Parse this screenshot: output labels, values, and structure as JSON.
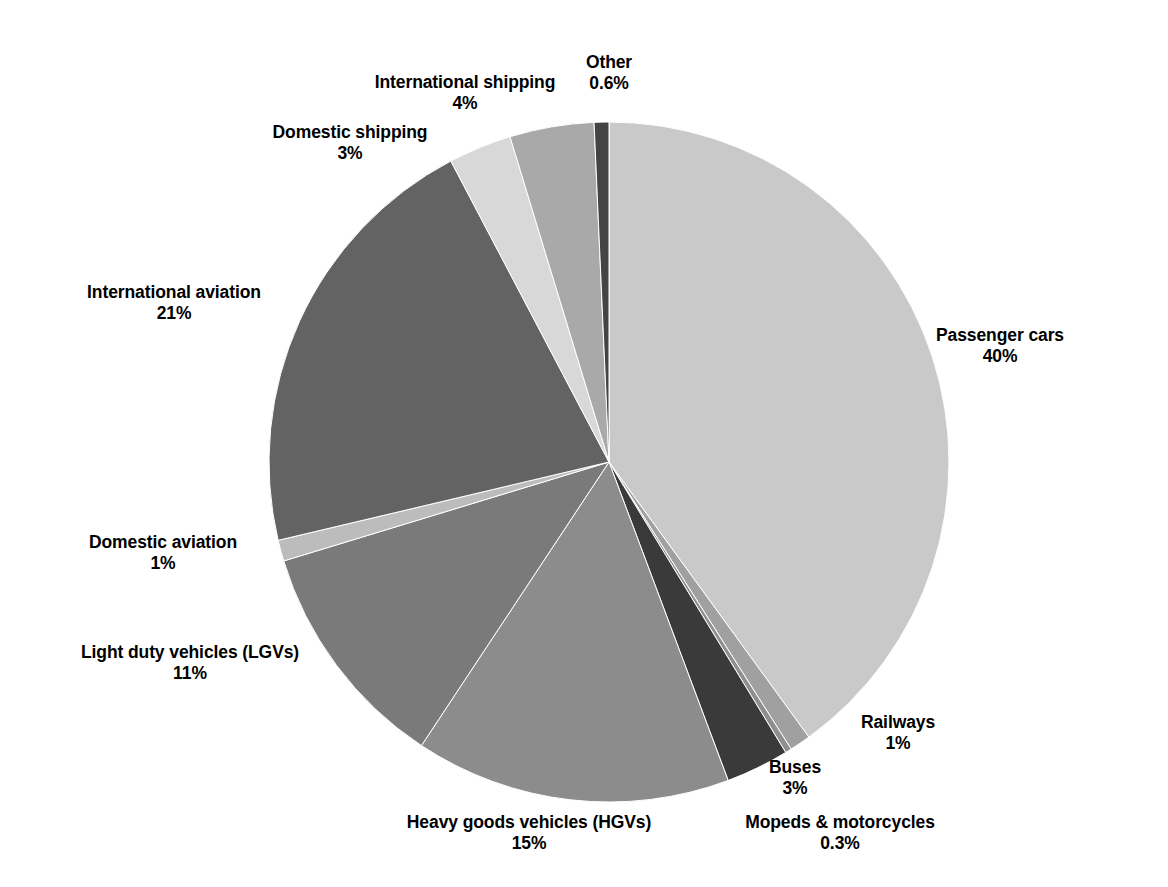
{
  "chart_data": {
    "type": "pie",
    "title": "",
    "subtitle": "",
    "xlabel": "",
    "ylabel": "",
    "legend_position": "none",
    "grid": false,
    "units": "percent",
    "label_format": "name on first line, percentage on second line",
    "start_angle_deg": 0,
    "direction": "clockwise from 12 o'clock",
    "categories": [
      "Passenger cars",
      "Railways",
      "Mopeds & motorcycles",
      "Buses",
      "Heavy goods vehicles (HGVs)",
      "Light duty vehicles (LGVs)",
      "Domestic aviation",
      "International aviation",
      "Domestic shipping",
      "International shipping",
      "Other"
    ],
    "values": [
      40,
      1,
      0.3,
      3,
      15,
      11,
      1,
      21,
      3,
      4,
      0.6
    ],
    "value_labels": [
      "40%",
      "1%",
      "0.3%",
      "3%",
      "15%",
      "11%",
      "1%",
      "21%",
      "3%",
      "4%",
      "0.6%"
    ],
    "colors": [
      "#c9c9c9",
      "#a0a0a0",
      "#8f8f8f",
      "#3a3a3a",
      "#8c8c8c",
      "#7a7a7a",
      "#bcbcbc",
      "#636363",
      "#d8d8d8",
      "#a9a9a9",
      "#444444"
    ],
    "slices": [
      {
        "name": "Passenger cars",
        "value": 40,
        "value_label": "40%",
        "color": "#c9c9c9",
        "start_deg": 0,
        "end_deg": 144,
        "label_x": 1000,
        "label_y": 325,
        "anchor": "center"
      },
      {
        "name": "Railways",
        "value": 1,
        "value_label": "1%",
        "color": "#a0a0a0",
        "start_deg": 144,
        "end_deg": 147.6,
        "label_x": 898,
        "label_y": 712,
        "anchor": "center"
      },
      {
        "name": "Mopeds & motorcycles",
        "value": 0.3,
        "value_label": "0.3%",
        "color": "#8f8f8f",
        "start_deg": 147.6,
        "end_deg": 148.68,
        "label_x": 840,
        "label_y": 812,
        "anchor": "center"
      },
      {
        "name": "Buses",
        "value": 3,
        "value_label": "3%",
        "color": "#3a3a3a",
        "start_deg": 148.68,
        "end_deg": 159.48,
        "label_x": 795,
        "label_y": 757,
        "anchor": "center"
      },
      {
        "name": "Heavy goods vehicles (HGVs)",
        "value": 15,
        "value_label": "15%",
        "color": "#8c8c8c",
        "start_deg": 159.48,
        "end_deg": 213.48,
        "label_x": 529,
        "label_y": 812,
        "anchor": "center"
      },
      {
        "name": "Light duty vehicles (LGVs)",
        "value": 11,
        "value_label": "11%",
        "color": "#7a7a7a",
        "start_deg": 213.48,
        "end_deg": 253.08,
        "label_x": 190,
        "label_y": 642,
        "anchor": "center"
      },
      {
        "name": "Domestic aviation",
        "value": 1,
        "value_label": "1%",
        "color": "#bcbcbc",
        "start_deg": 253.08,
        "end_deg": 256.68,
        "label_x": 163,
        "label_y": 532,
        "anchor": "center"
      },
      {
        "name": "International aviation",
        "value": 21,
        "value_label": "21%",
        "color": "#636363",
        "start_deg": 256.68,
        "end_deg": 332.28,
        "label_x": 174,
        "label_y": 282,
        "anchor": "center"
      },
      {
        "name": "Domestic shipping",
        "value": 3,
        "value_label": "3%",
        "color": "#d8d8d8",
        "start_deg": 332.28,
        "end_deg": 343.08,
        "label_x": 350,
        "label_y": 122,
        "anchor": "center"
      },
      {
        "name": "International shipping",
        "value": 4,
        "value_label": "4%",
        "color": "#a9a9a9",
        "start_deg": 343.08,
        "end_deg": 357.48,
        "label_x": 465,
        "label_y": 72,
        "anchor": "center"
      },
      {
        "name": "Other",
        "value": 0.6,
        "value_label": "0.6%",
        "color": "#444444",
        "start_deg": 357.48,
        "end_deg": 360,
        "label_x": 609,
        "label_y": 52,
        "anchor": "center"
      }
    ],
    "geometry": {
      "center_x": 609,
      "center_y": 462,
      "radius": 340
    }
  }
}
